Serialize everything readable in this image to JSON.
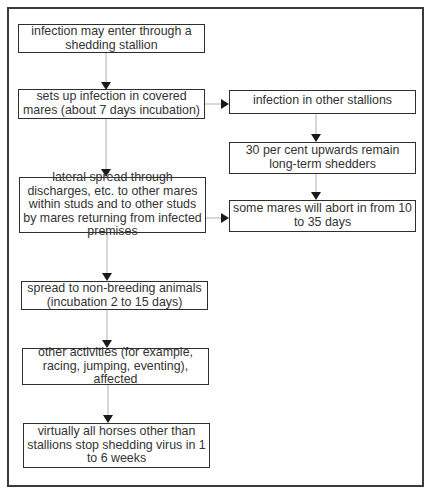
{
  "diagram": {
    "type": "flowchart",
    "nodes": [
      {
        "id": "n1",
        "text": "infection may enter through a shedding stallion"
      },
      {
        "id": "n2",
        "text": "sets up infection in covered mares (about 7 days incubation)"
      },
      {
        "id": "n3",
        "text": "infection in other stallions"
      },
      {
        "id": "n4",
        "text": "30 per cent upwards remain long-term shedders"
      },
      {
        "id": "n5",
        "text": "lateral spread through discharges, etc. to other mares within studs and to other studs by mares returning from infected premises"
      },
      {
        "id": "n6",
        "text": "some mares will abort in from 10 to 35 days"
      },
      {
        "id": "n7",
        "text": "spread to non-breeding animals (incubation 2 to 15 days)"
      },
      {
        "id": "n8",
        "text": "other activities (for example, racing, jumping, eventing), affected"
      },
      {
        "id": "n9",
        "text": "virtually all horses other than stallions stop shedding virus in 1 to 6 weeks"
      }
    ],
    "edges": [
      {
        "from": "n1",
        "to": "n2"
      },
      {
        "from": "n2",
        "to": "n3"
      },
      {
        "from": "n2",
        "to": "n5"
      },
      {
        "from": "n3",
        "to": "n4"
      },
      {
        "from": "n4",
        "to": "n6"
      },
      {
        "from": "n5",
        "to": "n6"
      },
      {
        "from": "n5",
        "to": "n7"
      },
      {
        "from": "n7",
        "to": "n8"
      },
      {
        "from": "n8",
        "to": "n9"
      }
    ],
    "colors": {
      "line": "#b0b0b0",
      "arrowhead": "#1a1a1a",
      "border": "#2e2e2e",
      "text": "#333333"
    }
  }
}
